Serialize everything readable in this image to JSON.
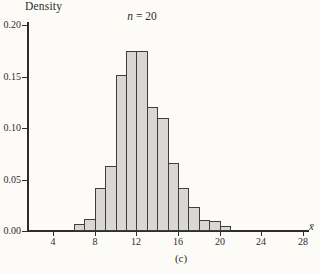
{
  "figure": {
    "ylabel": "Density",
    "title": {
      "symbol": "n",
      "eq": "=",
      "value": "20"
    },
    "xlabel": "x̄",
    "caption": "(c)"
  },
  "chart_data": {
    "type": "bar",
    "subtype": "histogram",
    "ylabel": "Density",
    "xlabel": "x̄",
    "caption": "(c)",
    "bin_width": 1,
    "bin_edges": [
      6,
      7,
      8,
      9,
      10,
      11,
      12,
      13,
      14,
      15,
      16,
      17,
      18,
      19,
      20,
      21
    ],
    "densities": [
      0.007,
      0.012,
      0.042,
      0.063,
      0.151,
      0.175,
      0.175,
      0.12,
      0.11,
      0.066,
      0.042,
      0.023,
      0.011,
      0.01,
      0.005
    ],
    "x_ticks": [
      4,
      8,
      12,
      16,
      20,
      24,
      28
    ],
    "y_ticks": [
      0,
      0.05,
      0.1,
      0.15,
      0.2
    ],
    "y_tick_labels": [
      "0.00",
      "0.05",
      "0.10",
      "0.15",
      "0.20"
    ],
    "xlim": [
      4,
      29
    ],
    "ylim": [
      0,
      0.21
    ],
    "grid": false,
    "legend": "none",
    "bar_fill": "#d8d7d3",
    "bar_stroke": "#3e3e3e"
  }
}
